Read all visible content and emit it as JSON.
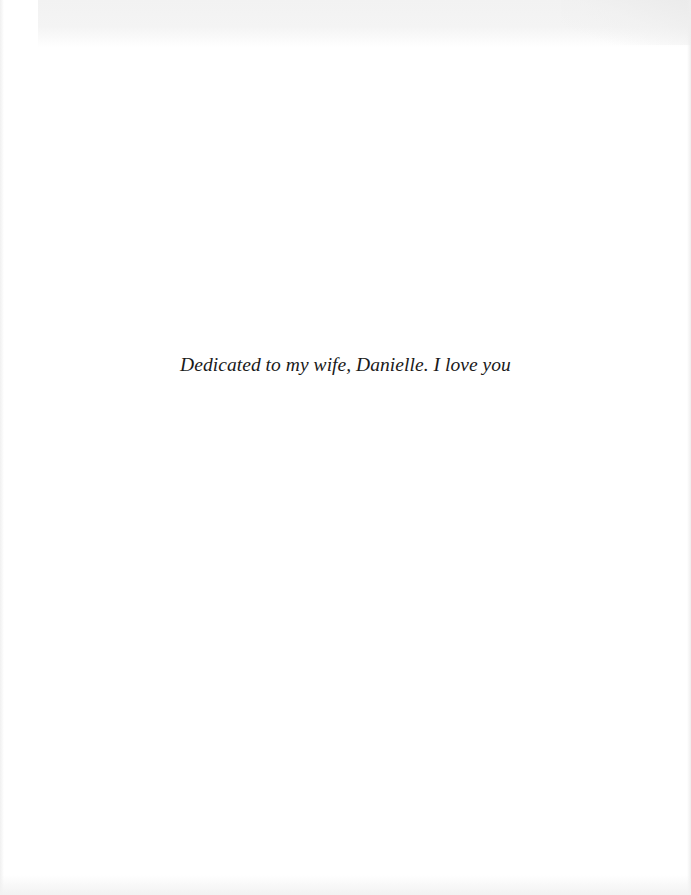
{
  "page": {
    "type": "dedication-page",
    "dedication_text": "Dedicated to my wife, Danielle. I love you"
  },
  "colors": {
    "paper": "#ffffff",
    "text": "#1a1a1a",
    "scan_shadow": "#f2f2f2"
  }
}
